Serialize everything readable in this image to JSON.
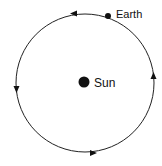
{
  "diagram": {
    "orbit": {
      "cx": 85,
      "cy": 83,
      "r": 69,
      "stroke": "#222222",
      "direction": "counterclockwise"
    },
    "sun": {
      "label": "Sun",
      "cx": 84,
      "cy": 82,
      "r": 5.5,
      "color": "#111111"
    },
    "earth": {
      "label": "Earth",
      "cx": 108,
      "cy": 16,
      "r": 3,
      "color": "#111111"
    },
    "arrows": [
      {
        "position": "top",
        "x": 73,
        "y": 14,
        "angle": 180
      },
      {
        "position": "left",
        "x": 17,
        "y": 89,
        "angle": 90
      },
      {
        "position": "bottom",
        "x": 93,
        "y": 153,
        "angle": 0
      },
      {
        "position": "right",
        "x": 153,
        "y": 76,
        "angle": -90
      }
    ]
  }
}
